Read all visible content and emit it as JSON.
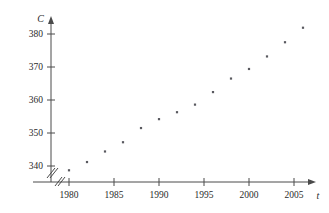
{
  "chart_data": {
    "type": "scatter",
    "title": "",
    "xlabel": "t",
    "ylabel": "C",
    "x": [
      1980,
      1982,
      1984,
      1986,
      1988,
      1990,
      1992,
      1994,
      1996,
      1998,
      2000,
      2002,
      2004,
      2006
    ],
    "values": [
      338.7,
      341.2,
      344.4,
      347.2,
      351.5,
      354.2,
      356.3,
      358.6,
      362.4,
      366.5,
      369.4,
      373.2,
      377.5,
      381.9
    ],
    "xlim": [
      1978.6,
      2007.8
    ],
    "ylim": [
      335.0,
      383.5
    ],
    "xticks": [
      1980,
      1985,
      1990,
      1995,
      2000,
      2005
    ],
    "xticklabels": [
      "1980",
      "1985",
      "1990",
      "1995",
      "2000",
      "2005"
    ],
    "yticks": [
      340,
      350,
      360,
      370,
      380
    ],
    "yticklabels": [
      "340",
      "350",
      "360",
      "370",
      "380"
    ],
    "grid": false,
    "legend": null,
    "axis_break_x": true,
    "axis_break_y": true,
    "marker_color": "#59595f",
    "axis_color": "#4a4a4a"
  },
  "axes": {
    "y_label": "C",
    "x_label": "t"
  }
}
